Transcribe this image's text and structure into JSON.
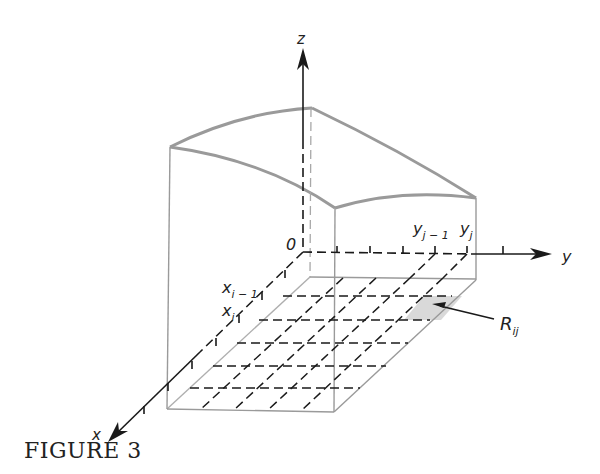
{
  "figure": {
    "caption": "FIGURE 3",
    "axes": {
      "x_label": "x",
      "y_label": "y",
      "z_label": "z",
      "origin_label": "0"
    },
    "tick_labels": {
      "x_prev": "x",
      "x_prev_sub": "i − 1",
      "x_curr": "x",
      "x_curr_sub": "i",
      "y_prev": "y",
      "y_prev_sub": "j − 1",
      "y_curr": "y",
      "y_curr_sub": "j"
    },
    "subrectangle_label": "R",
    "subrectangle_sub": "ij",
    "colors": {
      "axis": "#1a1a1a",
      "solid_edges": "#9a9a9a",
      "highlight": "#d9d9d9"
    }
  }
}
